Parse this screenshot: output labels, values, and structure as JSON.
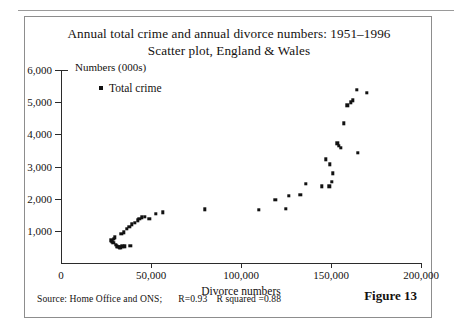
{
  "figure": {
    "label": "Figure 13",
    "title_line1": "Annual total crime and annual divorce numbers: 1951–1996",
    "title_line2": "Scatter plot, England & Wales",
    "source_text": "Source: Home Office and ONS;",
    "r_text": "R=0.93",
    "r_squared_text": "R squared =0.88"
  },
  "chart_data": {
    "type": "scatter",
    "title": "Annual total crime and annual divorce numbers: 1951–1996 Scatter plot, England & Wales",
    "xlabel": "Divorce numbers",
    "ylabel": "Numbers (000s)",
    "xlim": [
      0,
      200000
    ],
    "ylim": [
      0,
      6000
    ],
    "xticks": [
      0,
      50000,
      100000,
      150000,
      200000
    ],
    "xtick_labels": [
      "0",
      "50,000",
      "100,000",
      "150,000",
      "200,000"
    ],
    "yticks": [
      0,
      1000,
      2000,
      3000,
      4000,
      5000,
      6000
    ],
    "ytick_labels": [
      "0",
      "1,000",
      "2,000",
      "3,000",
      "4,000",
      "5,000",
      "6,000"
    ],
    "grid": false,
    "legend_position": "top-left",
    "marker": "square",
    "marker_color": "#111111",
    "series": [
      {
        "name": "Total crime",
        "points": [
          [
            28000,
            700
          ],
          [
            28500,
            660
          ],
          [
            29000,
            620
          ],
          [
            29500,
            760
          ],
          [
            30000,
            800
          ],
          [
            30500,
            560
          ],
          [
            31000,
            520
          ],
          [
            31500,
            500
          ],
          [
            32000,
            500
          ],
          [
            32500,
            480
          ],
          [
            33000,
            490
          ],
          [
            34000,
            520
          ],
          [
            35500,
            520
          ],
          [
            38500,
            540
          ],
          [
            33500,
            900
          ],
          [
            35000,
            960
          ],
          [
            36500,
            1060
          ],
          [
            38000,
            1130
          ],
          [
            39500,
            1200
          ],
          [
            41000,
            1250
          ],
          [
            42500,
            1330
          ],
          [
            43500,
            1370
          ],
          [
            45000,
            1420
          ],
          [
            46500,
            1440
          ],
          [
            49000,
            1370
          ],
          [
            52500,
            1520
          ],
          [
            56500,
            1580
          ],
          [
            80000,
            1670
          ],
          [
            110000,
            1660
          ],
          [
            119000,
            1960
          ],
          [
            125000,
            1680
          ],
          [
            126500,
            2090
          ],
          [
            133000,
            2120
          ],
          [
            136000,
            2460
          ],
          [
            145000,
            2380
          ],
          [
            149000,
            2390
          ],
          [
            150500,
            2530
          ],
          [
            147000,
            3220
          ],
          [
            149500,
            3070
          ],
          [
            151000,
            2790
          ],
          [
            153500,
            3720
          ],
          [
            154500,
            3650
          ],
          [
            155500,
            3590
          ],
          [
            165000,
            3420
          ],
          [
            157000,
            4340
          ],
          [
            159000,
            4900
          ],
          [
            161000,
            5000
          ],
          [
            162000,
            5060
          ],
          [
            164500,
            5380
          ],
          [
            170000,
            5300
          ]
        ]
      }
    ]
  }
}
